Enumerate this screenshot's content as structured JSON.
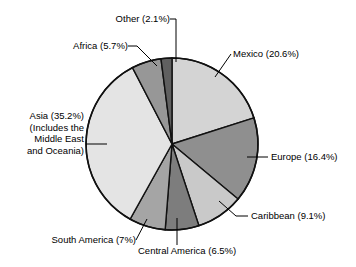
{
  "chart_data": {
    "type": "pie",
    "title": "",
    "subtitle": "",
    "xlabel": "",
    "ylabel": "",
    "legend_position": "none",
    "grid": false,
    "unit": "%",
    "start_angle_deg": 0,
    "direction": "clockwise",
    "categories": [
      "Mexico",
      "Europe",
      "Caribbean",
      "Central America",
      "South America",
      "Asia (Includes the Middle East and Oceania)",
      "Africa",
      "Other"
    ],
    "values": [
      20.6,
      16.4,
      9.1,
      6.5,
      7.0,
      35.2,
      5.7,
      2.1
    ],
    "slices": [
      {
        "name": "Mexico",
        "value": 20.6,
        "label": "Mexico (20.6%)",
        "color": "#d4d4d4",
        "label_side": "right"
      },
      {
        "name": "Europe",
        "value": 16.4,
        "label": "Europe (16.4%)",
        "color": "#8f8f8f",
        "label_side": "right"
      },
      {
        "name": "Caribbean",
        "value": 9.1,
        "label": "Caribbean (9.1%)",
        "color": "#c9c9c9",
        "label_side": "right"
      },
      {
        "name": "Central America",
        "value": 6.5,
        "label": "Central America (6.5%)",
        "color": "#7d7d7d",
        "label_side": "bottom"
      },
      {
        "name": "South America",
        "value": 7.0,
        "label": "South America (7%)",
        "color": "#a5a5a5",
        "label_side": "left"
      },
      {
        "name": "Asia",
        "value": 35.2,
        "label": "Asia (35.2%)",
        "label_lines": [
          "Asia (35.2%)",
          "(Includes the",
          "Middle East",
          "and Oceania)"
        ],
        "color": "#e4e4e4",
        "label_side": "left"
      },
      {
        "name": "Africa",
        "value": 5.7,
        "label": "Africa (5.7%)",
        "color": "#979797",
        "label_side": "left"
      },
      {
        "name": "Other",
        "value": 2.1,
        "label": "Other (2.1%)",
        "color": "#606060",
        "label_side": "top"
      }
    ]
  },
  "labels": {
    "other": "Other (2.1%)",
    "africa": "Africa (5.7%)",
    "mexico": "Mexico (20.6%)",
    "asia_line1": "Asia (35.2%)",
    "asia_line2": "(Includes the",
    "asia_line3": "Middle East",
    "asia_line4": "and Oceania)",
    "europe": "Europe (16.4%)",
    "caribbean": "Caribbean (9.1%)",
    "central_america": "Central America (6.5%)",
    "south_america": "South America (7%)"
  }
}
